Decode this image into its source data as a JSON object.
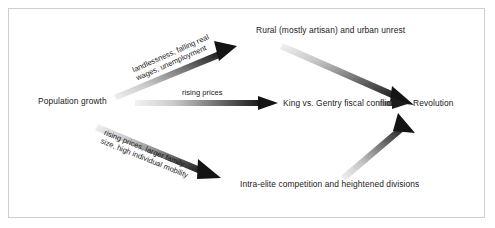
{
  "figure": {
    "type": "causal-flow-diagram",
    "background_color": "#ffffff",
    "border_color": "#cfcfcf",
    "text_color": "#1a1a1a",
    "arrow_color_dark": "#1a1a1a",
    "arrow_color_light": "#e8e8e8"
  },
  "nodes": {
    "population_growth": "Population growth",
    "rural_urban_unrest": "Rural (mostly artisan) and urban unrest",
    "king_gentry_conflict": "King vs. Gentry fiscal conflict",
    "intra_elite_competition": "Intra-elite competition and heightened divisions",
    "revolution": "Revolution"
  },
  "edge_labels": {
    "landlessness_line1": "landlessness, falling real",
    "landlessness_line2": "wages, unemployment",
    "rising_prices": "rising prices",
    "family_line1": "rising prices, larger family",
    "family_line2": "size, high individual mobility"
  },
  "edges": [
    {
      "name": "population-to-rural-unrest",
      "from": "population_growth",
      "to": "rural_urban_unrest",
      "label": "landlessness, falling real wages, unemployment",
      "direction": "up-right"
    },
    {
      "name": "population-to-king-gentry",
      "from": "population_growth",
      "to": "king_gentry_conflict",
      "label": "rising prices",
      "direction": "right"
    },
    {
      "name": "population-to-intra-elite",
      "from": "population_growth",
      "to": "intra_elite_competition",
      "label": "rising prices, larger family size, high individual mobility",
      "direction": "down-right"
    },
    {
      "name": "rural-unrest-to-revolution",
      "from": "rural_urban_unrest",
      "to": "revolution",
      "label": "",
      "direction": "down-right"
    },
    {
      "name": "king-gentry-to-revolution",
      "from": "king_gentry_conflict",
      "to": "revolution",
      "label": "",
      "direction": "right"
    },
    {
      "name": "intra-elite-to-revolution",
      "from": "intra_elite_competition",
      "to": "revolution",
      "label": "",
      "direction": "up-right"
    }
  ]
}
